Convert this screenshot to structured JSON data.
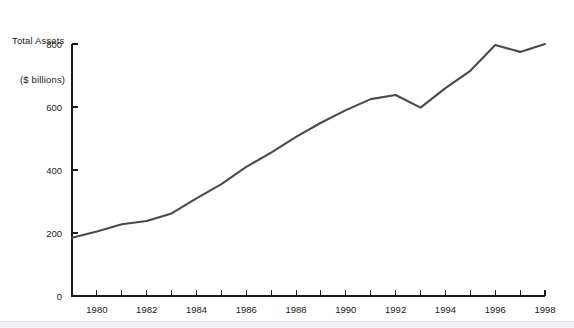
{
  "chart_data": {
    "type": "line",
    "title": "Total Assets ($ billions)",
    "title_line1": "Total Assets",
    "title_line2": "($ billions)",
    "xlabel": "",
    "ylabel": "Total Assets ($ billions)",
    "x": [
      1979,
      1980,
      1981,
      1982,
      1983,
      1984,
      1985,
      1986,
      1987,
      1988,
      1989,
      1990,
      1991,
      1992,
      1993,
      1994,
      1995,
      1996,
      1997,
      1998
    ],
    "values": [
      185,
      205,
      228,
      238,
      262,
      310,
      355,
      410,
      455,
      505,
      550,
      590,
      625,
      638,
      598,
      660,
      715,
      797,
      775,
      800
    ],
    "series": [
      {
        "name": "Total Assets",
        "values": [
          185,
          205,
          228,
          238,
          262,
          310,
          355,
          410,
          455,
          505,
          550,
          590,
          625,
          638,
          598,
          660,
          715,
          797,
          775,
          800
        ]
      }
    ],
    "xlim": [
      1979,
      1998
    ],
    "ylim": [
      0,
      800
    ],
    "yticks": [
      0,
      200,
      400,
      600,
      800
    ],
    "ytick_labels": [
      "0",
      "200",
      "400",
      "600",
      "800"
    ],
    "xticks": [
      1979,
      1980,
      1981,
      1982,
      1983,
      1984,
      1985,
      1986,
      1987,
      1988,
      1989,
      1990,
      1991,
      1992,
      1993,
      1994,
      1995,
      1996,
      1997,
      1998
    ],
    "xtick_labels_shown": [
      "1980",
      "1982",
      "1984",
      "1986",
      "1988",
      "1990",
      "1992",
      "1994",
      "1996",
      "1998"
    ],
    "xtick_labeled_years": [
      1980,
      1982,
      1984,
      1986,
      1988,
      1990,
      1992,
      1994,
      1996,
      1998
    ],
    "grid": false,
    "legend": false,
    "legend_position": "none",
    "line_color": "#4a4a4a",
    "axis_color": "#1a1a1a",
    "background_color": "#ffffff"
  }
}
